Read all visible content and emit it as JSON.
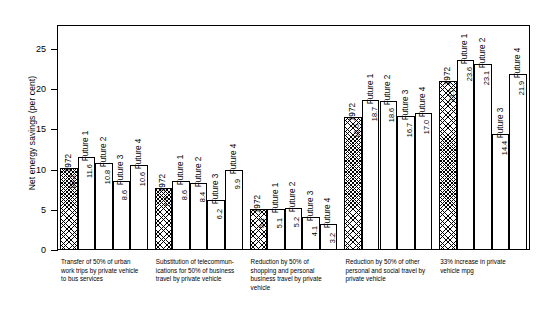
{
  "chart_data": {
    "type": "bar",
    "title": "",
    "xlabel": "",
    "ylabel": "Net energy savings (per cent)",
    "ylim": [
      0,
      28
    ],
    "yticks": [
      0,
      5,
      10,
      15,
      20,
      25
    ],
    "grid": false,
    "legend": "none",
    "series_names": [
      "1972",
      "Future 1",
      "Future 2",
      "Future 3",
      "Future 4"
    ],
    "categories": [
      "Transfer of 50% of urban work trips by private vehicle to bus services",
      "Substitution of telecommunications for 50% of business travel by private vehicle",
      "Reduction by 50% of shopping and personal business travel by private vehicle",
      "Reduction by 50% of other personal and social travel by private vehicle",
      "33% increase in private vehicle mpg"
    ],
    "series": [
      {
        "name": "1972",
        "values": [
          10.2,
          7.7,
          5.1,
          16.6,
          21.0
        ]
      },
      {
        "name": "Future 1",
        "values": [
          11.6,
          8.6,
          5.1,
          18.7,
          23.6
        ]
      },
      {
        "name": "Future 2",
        "values": [
          10.8,
          8.4,
          5.2,
          18.6,
          23.1
        ]
      },
      {
        "name": "Future 3",
        "values": [
          8.6,
          6.2,
          4.1,
          16.7,
          14.4
        ]
      },
      {
        "name": "Future 4",
        "values": [
          10.6,
          9.9,
          3.2,
          17.0,
          21.9
        ]
      }
    ]
  },
  "axis": {
    "ytick_labels": [
      "0",
      "5",
      "10",
      "15",
      "20",
      "25"
    ],
    "y_title": "Net energy savings (per cent)"
  },
  "groups": [
    {
      "caption_lines": [
        "Transfer of 50% of urban",
        "work trips by private vehicle",
        "to bus services"
      ],
      "bars": [
        {
          "series": "1972",
          "value": "10.2",
          "hatched": true
        },
        {
          "series": "Future 1",
          "value": "11.6",
          "hatched": false
        },
        {
          "series": "Future 2",
          "value": "10.8",
          "hatched": false
        },
        {
          "series": "Future 3",
          "value": "8.6",
          "hatched": false
        },
        {
          "series": "Future 4",
          "value": "10.6",
          "hatched": false
        }
      ]
    },
    {
      "caption_lines": [
        "Substitution of telecommun-",
        "ications for 50% of business",
        "travel by private vehicle"
      ],
      "bars": [
        {
          "series": "1972",
          "value": "7.7",
          "hatched": true
        },
        {
          "series": "Future 1",
          "value": "8.6",
          "hatched": false
        },
        {
          "series": "Future 2",
          "value": "8.4",
          "hatched": false
        },
        {
          "series": "Future 3",
          "value": "6.2",
          "hatched": false
        },
        {
          "series": "Future 4",
          "value": "9.9",
          "hatched": false
        }
      ]
    },
    {
      "caption_lines": [
        "Reduction by 50% of",
        "shopping and personal",
        "business travel by private",
        "vehicle"
      ],
      "bars": [
        {
          "series": "1972",
          "value": "5.1",
          "hatched": true
        },
        {
          "series": "Future 1",
          "value": "5.1",
          "hatched": false
        },
        {
          "series": "Future 2",
          "value": "5.2",
          "hatched": false
        },
        {
          "series": "Future 3",
          "value": "4.1",
          "hatched": false
        },
        {
          "series": "Future 4",
          "value": "3.2",
          "hatched": false
        }
      ]
    },
    {
      "caption_lines": [
        "Reduction by 50% of other",
        "personal and social travel by",
        "private vehicle"
      ],
      "bars": [
        {
          "series": "1972",
          "value": "16.6",
          "hatched": true
        },
        {
          "series": "Future 1",
          "value": "18.7",
          "hatched": false
        },
        {
          "series": "Future 2",
          "value": "18.6",
          "hatched": false
        },
        {
          "series": "Future 3",
          "value": "16.7",
          "hatched": false
        },
        {
          "series": "Future 4",
          "value": "17.0",
          "hatched": false
        }
      ]
    },
    {
      "caption_lines": [
        "33% increase in private",
        "vehicle mpg"
      ],
      "bars": [
        {
          "series": "1972",
          "value": "21.0",
          "hatched": true
        },
        {
          "series": "Future 1",
          "value": "23.6",
          "hatched": false
        },
        {
          "series": "Future 2",
          "value": "23.1",
          "hatched": false
        },
        {
          "series": "Future 3",
          "value": "14.4",
          "hatched": false
        },
        {
          "series": "Future 4",
          "value": "21.9",
          "hatched": false
        }
      ]
    }
  ],
  "colors": {
    "axis": "#000000",
    "bar_fill": "#ffffff",
    "bar_edge": "#000000",
    "hatch": "#000000",
    "background": "#ffffff"
  }
}
